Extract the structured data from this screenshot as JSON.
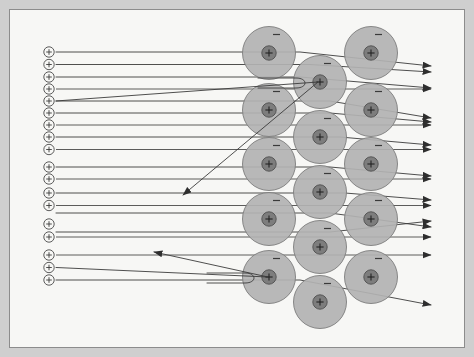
{
  "figure": {
    "domain_kind": "diagram",
    "canvas": {
      "width": 474,
      "height": 357
    },
    "colors": {
      "page_background": "#ffffff",
      "frame_border": "#cfcfcf",
      "panel_background": "#f7f7f5",
      "panel_border": "#8c8c8c",
      "beam_line": "#4a4a4a",
      "scatter_line": "#3b3b3b",
      "electron_cloud_fill": "#b2b2b2",
      "electron_cloud_stroke": "#7d7d7d",
      "nucleus_fill": "#7d7d7d",
      "nucleus_stroke": "#4f4f4f",
      "arrow_head": "#2e2e2e",
      "alpha_ring_fill": "#f7f7f5",
      "alpha_ring_stroke": "#4a4a4a"
    },
    "panel": {
      "x": 9,
      "y": 9,
      "width": 456,
      "height": 339
    }
  },
  "alpha_sources": {
    "label": "+",
    "symbol": "plus",
    "count": 18,
    "radius": 5.2,
    "cx": 49,
    "items": [
      {
        "cy": 52
      },
      {
        "cy": 64.5
      },
      {
        "cy": 77
      },
      {
        "cy": 89
      },
      {
        "cy": 101
      },
      {
        "cy": 113
      },
      {
        "cy": 125
      },
      {
        "cy": 137
      },
      {
        "cy": 149.5
      },
      {
        "cy": 167
      },
      {
        "cy": 179
      },
      {
        "cy": 193
      },
      {
        "cy": 205.5
      },
      {
        "cy": 224
      },
      {
        "cy": 237
      },
      {
        "cy": 255
      },
      {
        "cy": 267.5
      },
      {
        "cy": 280
      }
    ]
  },
  "foil": {
    "label": "metal foil atoms",
    "cloud_radius": 26.5,
    "nucleus_radius": 7.2,
    "electron_label": "-",
    "nucleus_label": "+",
    "columns": [
      {
        "name": "left-column",
        "cx": 269,
        "atoms": [
          {
            "cy": 53
          },
          {
            "cy": 110
          },
          {
            "cy": 164
          },
          {
            "cy": 219
          },
          {
            "cy": 277
          }
        ]
      },
      {
        "name": "middle-column",
        "cx": 320,
        "atoms": [
          {
            "cy": 82
          },
          {
            "cy": 137
          },
          {
            "cy": 192
          },
          {
            "cy": 247
          },
          {
            "cy": 302
          }
        ]
      },
      {
        "name": "right-column",
        "cx": 371,
        "atoms": [
          {
            "cy": 53
          },
          {
            "cy": 110
          },
          {
            "cy": 164
          },
          {
            "cy": 219
          },
          {
            "cy": 277
          }
        ]
      }
    ]
  },
  "beams": {
    "start_x": 56,
    "straight_through": [
      {
        "y": 89,
        "end_x": 432
      },
      {
        "y": 125,
        "end_x": 432
      },
      {
        "y": 149.5,
        "end_x": 432
      },
      {
        "y": 179,
        "end_x": 432
      },
      {
        "y": 205.5,
        "end_x": 432
      },
      {
        "y": 237,
        "end_x": 432
      },
      {
        "y": 255,
        "end_x": 432
      }
    ],
    "deflected": [
      {
        "name": "small-up-1",
        "y": 52,
        "hit_x": 300,
        "out_x": 432,
        "out_y": 66
      },
      {
        "name": "small-up-2",
        "y": 64.5,
        "hit_x": 310,
        "out_x": 432,
        "out_y": 72
      },
      {
        "name": "small-down-1",
        "y": 77,
        "hit_x": 300,
        "out_x": 432,
        "out_y": 88
      },
      {
        "name": "small-up-3",
        "y": 101,
        "hit_x": 330,
        "out_x": 432,
        "out_y": 118
      },
      {
        "name": "small-up-4",
        "y": 113,
        "hit_x": 330,
        "out_x": 432,
        "out_y": 122
      },
      {
        "name": "small-up-5",
        "y": 137,
        "hit_x": 340,
        "out_x": 432,
        "out_y": 145
      },
      {
        "name": "small-up-6",
        "y": 167,
        "hit_x": 330,
        "out_x": 432,
        "out_y": 176
      },
      {
        "name": "small-up-7",
        "y": 193,
        "hit_x": 345,
        "out_x": 432,
        "out_y": 200
      },
      {
        "name": "cross-down-1",
        "y": 213,
        "hit_x": 330,
        "out_x": 432,
        "out_y": 227
      },
      {
        "name": "cross-up-1",
        "y": 232,
        "hit_x": 330,
        "out_x": 432,
        "out_y": 221
      },
      {
        "name": "low-deflect",
        "y": 280,
        "hit_x": 300,
        "out_x": 432,
        "out_y": 305
      }
    ],
    "backscattered": [
      {
        "name": "steep-backscatter",
        "entry_y": 101,
        "turn_x": 318,
        "turn_y": 82,
        "tip_x": 183,
        "tip_y": 195
      },
      {
        "name": "shallow-backscatter",
        "entry_y": 267.5,
        "turn_x": 268,
        "turn_y": 277,
        "tip_x": 154,
        "tip_y": 252
      }
    ],
    "hooks": [
      {
        "name": "hook-upper",
        "nucleus_cx": 320,
        "nucleus_cy": 82
      },
      {
        "name": "hook-lower",
        "nucleus_cx": 269,
        "nucleus_cy": 277
      }
    ]
  }
}
